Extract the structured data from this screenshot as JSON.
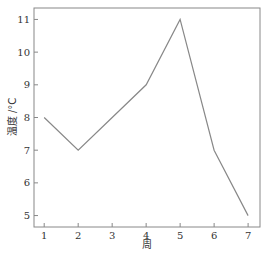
{
  "chart_data": {
    "type": "line",
    "title": "",
    "xlabel": "周",
    "ylabel": "温度 /°C",
    "x": [
      1,
      2,
      3,
      4,
      5,
      6,
      7
    ],
    "categories": [
      "1",
      "2",
      "3",
      "4",
      "5",
      "6",
      "7"
    ],
    "series": [
      {
        "name": "温度",
        "values": [
          8,
          7,
          8,
          9,
          11,
          7,
          5
        ],
        "color": "#888888"
      }
    ],
    "xlim": [
      0.7,
      7.35
    ],
    "ylim": [
      4.65,
      11.35
    ],
    "xticks": [
      1,
      2,
      3,
      4,
      5,
      6,
      7
    ],
    "yticks": [
      5,
      6,
      7,
      8,
      9,
      10,
      11
    ],
    "grid": false,
    "legend": null
  },
  "axes": {
    "xlabel": "周",
    "ylabel": "温度 /°C",
    "xtick_labels": [
      "1",
      "2",
      "3",
      "4",
      "5",
      "6",
      "7"
    ],
    "ytick_labels": [
      "5",
      "6",
      "7",
      "8",
      "9",
      "10",
      "11"
    ]
  },
  "colors": {
    "line": "#888888",
    "frame": "#888888",
    "text": "#333333"
  }
}
